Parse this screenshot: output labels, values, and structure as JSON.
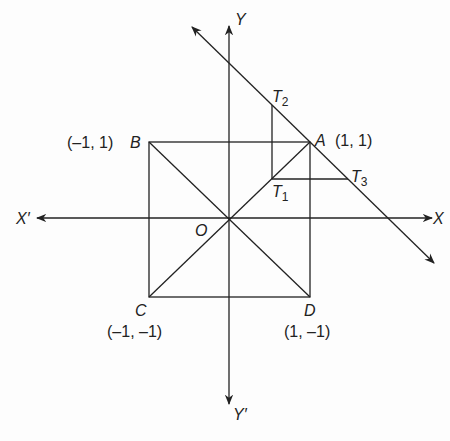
{
  "diagram": {
    "axes": {
      "x_pos_label": "X",
      "x_neg_label": "X′",
      "y_pos_label": "Y",
      "y_neg_label": "Y′",
      "origin_label": "O"
    },
    "points": {
      "A": {
        "name": "A",
        "coords": "(1, 1)"
      },
      "B": {
        "name": "B",
        "coords": "(–1, 1)"
      },
      "C": {
        "name": "C",
        "coords": "(–1, –1)"
      },
      "D": {
        "name": "D",
        "coords": "(1, –1)"
      },
      "T1": {
        "name": "T",
        "sub": "1"
      },
      "T2": {
        "name": "T",
        "sub": "2"
      },
      "T3": {
        "name": "T",
        "sub": "3"
      }
    },
    "colors": {
      "line": "#222222",
      "background": "#fdfdfd"
    }
  }
}
